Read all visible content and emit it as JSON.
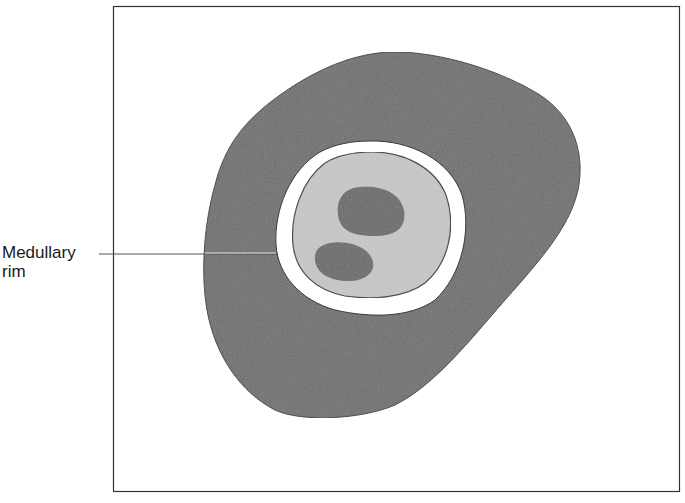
{
  "diagram": {
    "labels": [
      {
        "id": "medullary-rim",
        "lines": [
          "Medullary",
          "rim"
        ]
      }
    ],
    "colors": {
      "frame": "#333333",
      "outer_region": "#6f6f6f",
      "rim": "#ffffff",
      "inner_region": "#c9c9c9",
      "nuclei": "#6a6a6a",
      "outline": "#3a3a3a",
      "leader_line": "#555555"
    }
  }
}
